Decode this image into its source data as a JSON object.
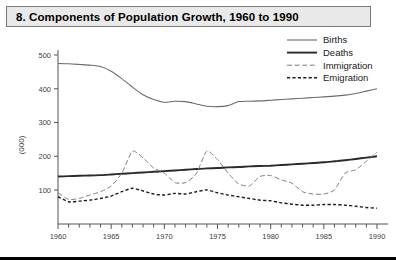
{
  "figure": {
    "title": "8. Components of Population Growth, 1960 to 1990"
  },
  "axes": {
    "ylabel": "(000)",
    "y_ticks": [
      "100",
      "200",
      "300",
      "400",
      "500"
    ],
    "x_ticks": [
      "1960",
      "1965",
      "1970",
      "1975",
      "1980",
      "1985",
      "1990"
    ]
  },
  "legend": {
    "items": [
      {
        "label": "Births"
      },
      {
        "label": "Deaths"
      },
      {
        "label": "Immigration"
      },
      {
        "label": "Emigration"
      }
    ]
  },
  "chart_data": {
    "type": "line",
    "title": "8. Components of Population Growth, 1960 to 1990",
    "xlabel": "",
    "ylabel": "(000)",
    "xlim": [
      1960,
      1990
    ],
    "ylim": [
      0,
      530
    ],
    "grid": false,
    "legend_position": "top-right",
    "x": [
      1960,
      1961,
      1962,
      1963,
      1964,
      1965,
      1966,
      1967,
      1968,
      1969,
      1970,
      1971,
      1972,
      1973,
      1974,
      1975,
      1976,
      1977,
      1978,
      1979,
      1980,
      1981,
      1982,
      1983,
      1984,
      1985,
      1986,
      1987,
      1988,
      1989,
      1990
    ],
    "series": [
      {
        "name": "Births",
        "style": "solid-thin",
        "color": "#6b6b6b",
        "values": [
          475,
          474,
          472,
          470,
          466,
          452,
          430,
          405,
          382,
          368,
          360,
          363,
          362,
          355,
          348,
          347,
          350,
          362,
          363,
          364,
          366,
          368,
          370,
          372,
          374,
          376,
          378,
          381,
          386,
          393,
          400
        ]
      },
      {
        "name": "Deaths",
        "style": "solid-thick",
        "color": "#2a2a2a",
        "values": [
          140,
          141,
          142,
          143,
          144,
          146,
          148,
          150,
          152,
          154,
          156,
          158,
          160,
          162,
          164,
          165,
          167,
          168,
          170,
          171,
          172,
          174,
          176,
          178,
          180,
          182,
          185,
          188,
          192,
          196,
          200
        ]
      },
      {
        "name": "Immigration",
        "style": "long-dash",
        "color": "#7d7d7d",
        "values": [
          92,
          72,
          75,
          85,
          95,
          112,
          150,
          215,
          195,
          165,
          150,
          122,
          122,
          148,
          215,
          190,
          150,
          118,
          112,
          140,
          143,
          130,
          120,
          95,
          88,
          88,
          100,
          150,
          160,
          185,
          212
        ]
      },
      {
        "name": "Emigration",
        "style": "short-dash",
        "color": "#1c1c1c",
        "values": [
          80,
          65,
          67,
          70,
          75,
          82,
          95,
          105,
          97,
          88,
          85,
          90,
          88,
          95,
          100,
          92,
          85,
          80,
          75,
          70,
          68,
          62,
          58,
          55,
          55,
          57,
          57,
          55,
          52,
          48,
          46
        ]
      }
    ]
  }
}
